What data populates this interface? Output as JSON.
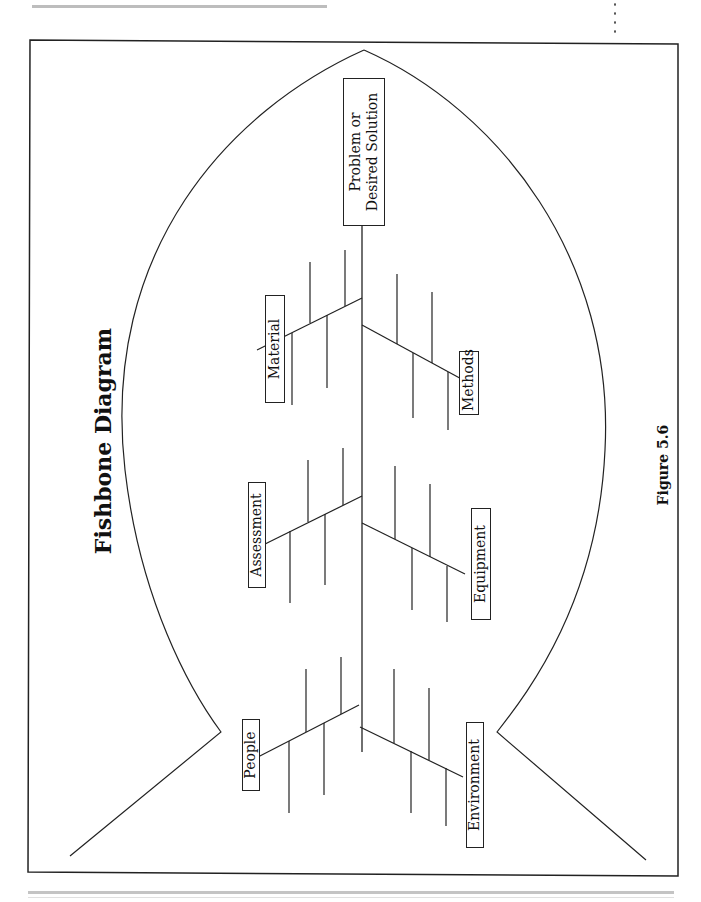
{
  "page": {
    "title": "Fishbone Diagram",
    "caption": "Figure 5.6"
  },
  "diagram": {
    "type": "fishbone",
    "head": {
      "line1": "Problem or",
      "line2": "Desired Solution"
    },
    "categories": [
      {
        "id": "material",
        "label": "Material",
        "side": "left"
      },
      {
        "id": "methods",
        "label": "Methods",
        "side": "right"
      },
      {
        "id": "assessment",
        "label": "Assessment",
        "side": "left"
      },
      {
        "id": "equipment",
        "label": "Equipment",
        "side": "right"
      },
      {
        "id": "people",
        "label": "People",
        "side": "left"
      },
      {
        "id": "environment",
        "label": "Environment",
        "side": "right"
      }
    ],
    "colors": {
      "line": "#222222",
      "background": "#ffffff",
      "rule": "#bdbdbd"
    }
  }
}
